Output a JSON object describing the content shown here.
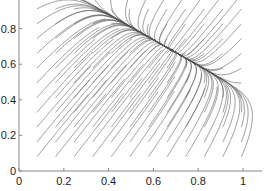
{
  "chart_data": {
    "type": "line",
    "subtype": "streamline phase portrait",
    "title": "",
    "xlabel": "",
    "ylabel": "",
    "xlim": [
      0,
      1.06
    ],
    "ylim": [
      0,
      1.0
    ],
    "grid": false,
    "legend": null,
    "x_ticks": [
      "0",
      "0.2",
      "0.4",
      "0.6",
      "0.8",
      "1"
    ],
    "y_ticks": [
      "0",
      "0.2",
      "0.4",
      "0.6",
      "0.8"
    ],
    "x_tick_values": [
      0,
      0.2,
      0.4,
      0.6,
      0.8,
      1
    ],
    "y_tick_values": [
      0,
      0.2,
      0.4,
      0.6,
      0.8
    ],
    "fixed_point": {
      "x": 0.68,
      "y": 0.68,
      "type": "stable node"
    },
    "slow_direction": [
      1,
      -0.72
    ],
    "fast_direction": [
      0.6,
      1
    ],
    "seed_grid": {
      "x_start": 0.08,
      "x_end": 1.0,
      "y_start": 0.08,
      "y_end": 1.0,
      "step": 0.083
    },
    "line_color": "#555555",
    "axis_color": "#888888"
  }
}
